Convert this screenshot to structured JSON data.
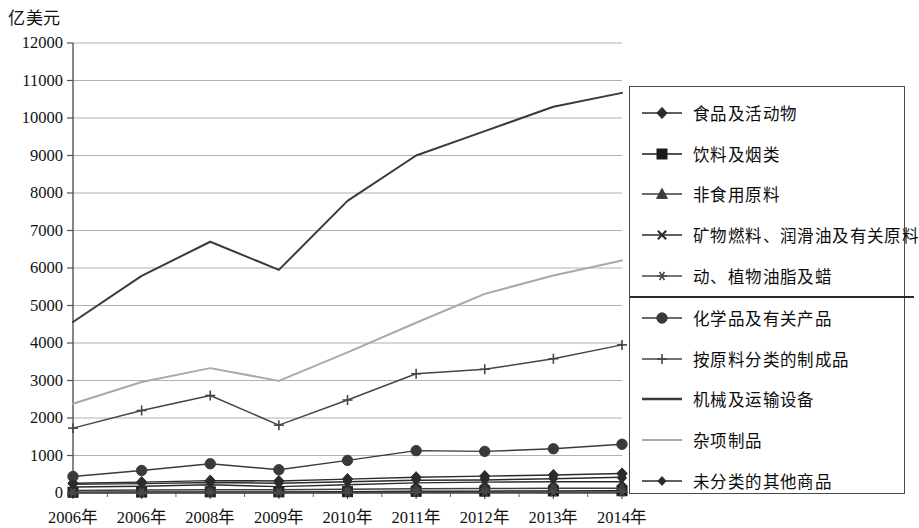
{
  "chart_data": {
    "type": "line",
    "title": "",
    "ylabel": "亿美元",
    "xlabel": "",
    "ylim": [
      0,
      12000
    ],
    "ytick_step": 1000,
    "yticks": [
      "0",
      "1000",
      "2000",
      "3000",
      "4000",
      "5000",
      "6000",
      "7000",
      "8000",
      "9000",
      "10000",
      "11000",
      "12000"
    ],
    "grid": true,
    "legend_position": "right",
    "categories": [
      "2006年",
      "2006年",
      "2008年",
      "2009年",
      "2010年",
      "2011年",
      "2012年",
      "2013年",
      "2014年"
    ],
    "series": [
      {
        "name": "食品及活动物",
        "marker": "diamond",
        "color": "#2b2b2b",
        "values": [
          260,
          290,
          330,
          320,
          370,
          420,
          450,
          480,
          520
        ]
      },
      {
        "name": "饮料及烟类",
        "marker": "square",
        "color": "#1a1a1a",
        "values": [
          20,
          25,
          30,
          30,
          35,
          45,
          50,
          55,
          60
        ]
      },
      {
        "name": "非食用原料",
        "marker": "triangle",
        "color": "#3d3d3d",
        "values": [
          70,
          80,
          90,
          85,
          100,
          115,
          120,
          125,
          130
        ]
      },
      {
        "name": "矿物燃料、润滑油及有关原料",
        "marker": "x",
        "color": "#2b2b2b",
        "values": [
          160,
          180,
          220,
          170,
          220,
          270,
          290,
          300,
          300
        ]
      },
      {
        "name": "动、植物油脂及蜡",
        "marker": "asterisk",
        "color": "#4a4a4a",
        "values": [
          10,
          12,
          15,
          13,
          16,
          18,
          20,
          22,
          24
        ]
      },
      {
        "name": "化学品及有关产品",
        "marker": "circle",
        "color": "#3a3a3a",
        "values": [
          440,
          600,
          780,
          620,
          870,
          1130,
          1110,
          1180,
          1300
        ]
      },
      {
        "name": "按原料分类的制成品",
        "marker": "plus",
        "color": "#454545",
        "values": [
          1730,
          2200,
          2600,
          1810,
          2480,
          3180,
          3300,
          3580,
          3950
        ]
      },
      {
        "name": "机械及运输设备",
        "marker": "none",
        "color": "#3a3a3a",
        "values": [
          4560,
          5790,
          6700,
          5950,
          7790,
          9000,
          9650,
          10300,
          10670
        ]
      },
      {
        "name": "杂项制品",
        "marker": "none",
        "color": "#a9a9a9",
        "values": [
          2380,
          2960,
          3330,
          2990,
          3750,
          4540,
          5310,
          5800,
          6200
        ]
      },
      {
        "name": "未分类的其他商品",
        "marker": "small-diamond",
        "color": "#2b2b2b",
        "values": [
          230,
          250,
          280,
          260,
          300,
          340,
          350,
          380,
          420
        ]
      }
    ]
  },
  "legend": {
    "divider_after_index": 4,
    "items": [
      {
        "label": "食品及活动物",
        "marker": "diamond"
      },
      {
        "label": "饮料及烟类",
        "marker": "square"
      },
      {
        "label": "非食用原料",
        "marker": "triangle"
      },
      {
        "label": "矿物燃料、润滑油及有关原料",
        "marker": "x"
      },
      {
        "label": "动、植物油脂及蜡",
        "marker": "asterisk"
      },
      {
        "label": "化学品及有关产品",
        "marker": "circle"
      },
      {
        "label": "按原料分类的制成品",
        "marker": "plus"
      },
      {
        "label": "机械及运输设备",
        "marker": "none"
      },
      {
        "label": "杂项制品",
        "marker": "none-light"
      },
      {
        "label": "未分类的其他商品",
        "marker": "small-diamond"
      }
    ]
  },
  "style": {
    "grid_color": "#8c8c8c",
    "axis_color": "#555555",
    "text_color": "#111111",
    "light_series_color": "#a9a9a9",
    "dark_series_color": "#3a3a3a"
  }
}
